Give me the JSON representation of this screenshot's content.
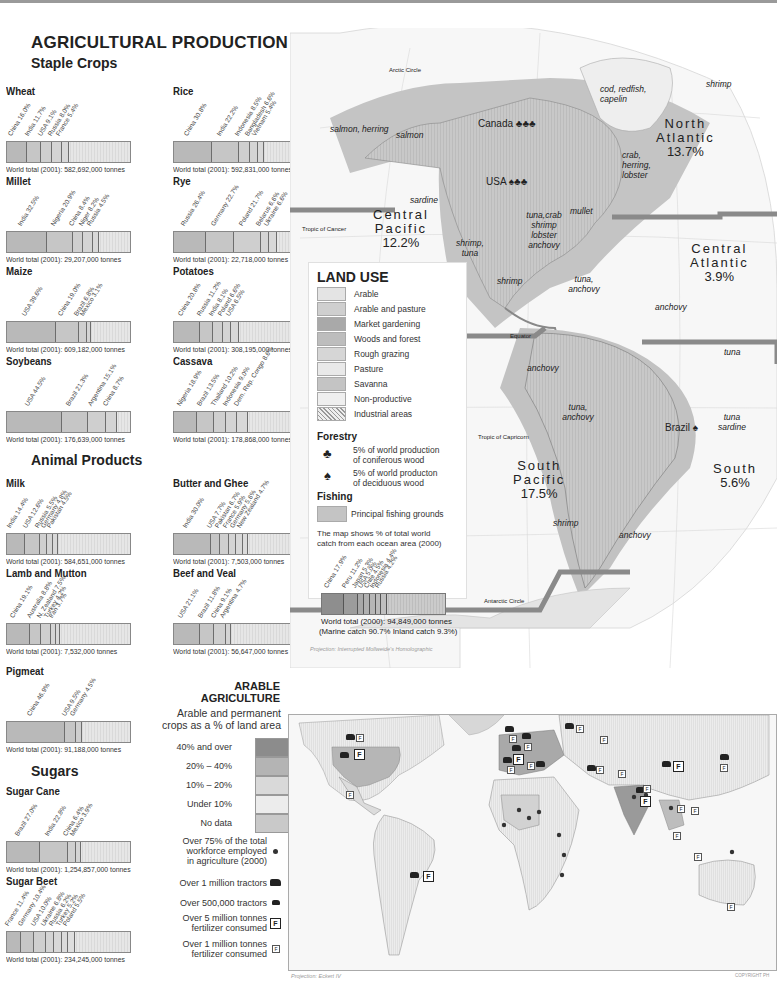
{
  "title": "AGRICULTURAL PRODUCTION",
  "sections": {
    "staple": "Staple Crops",
    "animal": "Animal Products",
    "sugars": "Sugars"
  },
  "chart_data": [
    {
      "type": "bar",
      "title": "Wheat",
      "stacked": true,
      "categories": [
        "China",
        "India",
        "USA",
        "Russia",
        "France"
      ],
      "values": [
        16.0,
        11.7,
        9.1,
        8.0,
        5.4
      ],
      "unit": "% of world total",
      "total": "World total (2001): 582,692,000 tonnes"
    },
    {
      "type": "bar",
      "title": "Rice",
      "stacked": true,
      "categories": [
        "China",
        "India",
        "Indonesia",
        "Bangladesh",
        "Vietnam"
      ],
      "values": [
        30.8,
        22.2,
        8.5,
        6.6,
        5.4
      ],
      "unit": "% of world total",
      "total": "World total (2001): 592,831,000 tonnes"
    },
    {
      "type": "bar",
      "title": "Millet",
      "stacked": true,
      "categories": [
        "India",
        "Nigeria",
        "China",
        "Niger",
        "Russia"
      ],
      "values": [
        32.5,
        20.9,
        8.4,
        8.2,
        4.5
      ],
      "unit": "% of world total",
      "total": "World total (2001): 29,207,000 tonnes"
    },
    {
      "type": "bar",
      "title": "Rye",
      "stacked": true,
      "categories": [
        "Russia",
        "Germany",
        "Poland",
        "Belarus",
        "Ukraine"
      ],
      "values": [
        26.4,
        22.7,
        21.7,
        6.6,
        6.6
      ],
      "unit": "% of world total",
      "total": "World total (2001): 22,718,000 tonnes"
    },
    {
      "type": "bar",
      "title": "Maize",
      "stacked": true,
      "categories": [
        "USA",
        "China",
        "Brazil",
        "Mexico"
      ],
      "values": [
        39.6,
        19.0,
        6.8,
        3.1
      ],
      "unit": "% of world total",
      "total": "World total (2001): 609,182,000 tonnes"
    },
    {
      "type": "bar",
      "title": "Potatoes",
      "stacked": true,
      "categories": [
        "China",
        "Russia",
        "India",
        "Poland",
        "USA"
      ],
      "values": [
        20.8,
        11.2,
        8.1,
        6.6,
        6.5
      ],
      "unit": "% of world total",
      "total": "World total (2001): 308,195,000 tonnes"
    },
    {
      "type": "bar",
      "title": "Soybeans",
      "stacked": true,
      "categories": [
        "USA",
        "Brazil",
        "Argentina",
        "China"
      ],
      "values": [
        44.5,
        21.3,
        15.1,
        8.7
      ],
      "unit": "% of world total",
      "total": "World total (2001): 176,639,000 tonnes"
    },
    {
      "type": "bar",
      "title": "Cassava",
      "stacked": true,
      "categories": [
        "Nigeria",
        "Brazil",
        "Thailand",
        "Indonesia",
        "Dem. Rep. Congo"
      ],
      "values": [
        18.9,
        13.5,
        10.2,
        9.0,
        8.6
      ],
      "unit": "% of world total",
      "total": "World total (2001): 178,868,000 tonnes"
    },
    {
      "type": "bar",
      "title": "Milk",
      "stacked": true,
      "categories": [
        "India",
        "USA",
        "Russia",
        "Germany",
        "Pakistan"
      ],
      "values": [
        14.4,
        12.6,
        5.5,
        4.8,
        4.5
      ],
      "unit": "% of world total",
      "total": "World total (2001): 584,651,000 tonnes"
    },
    {
      "type": "bar",
      "title": "Butter and Ghee",
      "stacked": true,
      "categories": [
        "India",
        "USA",
        "Pakistan",
        "France",
        "Germany",
        "New Zealand"
      ],
      "values": [
        30.0,
        7.7,
        6.7,
        5.9,
        5.6,
        4.7
      ],
      "unit": "% of world total",
      "total": "World total (2001): 7,503,000 tonnes"
    },
    {
      "type": "bar",
      "title": "Lamb and Mutton",
      "stacked": true,
      "categories": [
        "China",
        "Australia",
        "N. Zealand",
        "Turkey",
        "Iran"
      ],
      "values": [
        19.1,
        8.8,
        7.5,
        4.2,
        3.7
      ],
      "unit": "% of world total",
      "total": "World total (2001): 7,532,000 tonnes"
    },
    {
      "type": "bar",
      "title": "Beef and Veal",
      "stacked": true,
      "categories": [
        "USA",
        "Brazil",
        "China",
        "Argentina"
      ],
      "values": [
        21.1,
        11.8,
        9.1,
        4.7
      ],
      "unit": "% of world total",
      "total": "World total (2001): 56,647,000 tonnes"
    },
    {
      "type": "bar",
      "title": "Pigmeat",
      "stacked": true,
      "categories": [
        "China",
        "USA",
        "Germany"
      ],
      "values": [
        46.9,
        9.5,
        4.5
      ],
      "unit": "% of world total",
      "total": "World total (2001): 91,188,000 tonnes"
    },
    {
      "type": "bar",
      "title": "Sugar Cane",
      "stacked": true,
      "categories": [
        "Brazil",
        "India",
        "China",
        "Mexico"
      ],
      "values": [
        27.0,
        22.8,
        6.4,
        3.9
      ],
      "unit": "% of world total",
      "total": "World total (2001): 1,254,857,000 tonnes"
    },
    {
      "type": "bar",
      "title": "Sugar Beet",
      "stacked": true,
      "categories": [
        "France",
        "Germany",
        "USA",
        "Ukraine",
        "Russia",
        "Turkey",
        "Poland"
      ],
      "values": [
        11.4,
        10.4,
        10.0,
        6.8,
        6.2,
        5.2,
        5.5
      ],
      "unit": "% of world total",
      "total": "World total (2001): 234,245,000 tonnes"
    },
    {
      "type": "bar",
      "title": "Fishing catch",
      "stacked": true,
      "categories": [
        "China",
        "Peru",
        "Japan",
        "USA",
        "Chile",
        "Indonesia",
        "Russia"
      ],
      "values": [
        17.9,
        11.2,
        5.3,
        5.0,
        4.5,
        4.4,
        4.2
      ],
      "unit": "% of world total",
      "total": "World total (2000): 94,849,000 tonnes",
      "note": "(Marine catch 90.7%  Inland catch 9.3%)"
    }
  ],
  "charts": [
    {
      "title": "Wheat",
      "labels": [
        "China 16.0%",
        "India 11.7%",
        "USA 9.1%",
        "Russia 8.0%",
        "France 5.4%"
      ],
      "widths": [
        16.0,
        11.7,
        9.1,
        8.0,
        5.4
      ],
      "total": "World total (2001): 582,692,000 tonnes"
    },
    {
      "title": "Rice",
      "labels": [
        "China 30.8%",
        "India 22.2%",
        "Indonesia 8.5%",
        "Bangladesh 6.6%",
        "Vietnam 5.4%"
      ],
      "widths": [
        30.8,
        22.2,
        8.5,
        6.6,
        5.4
      ],
      "total": "World total (2001): 592,831,000 tonnes"
    },
    {
      "title": "Millet",
      "labels": [
        "India 32.5%",
        "Nigeria 20.9%",
        "China 8.4%",
        "Niger 8.2%",
        "Russia 4.5%"
      ],
      "widths": [
        32.5,
        20.9,
        8.4,
        8.2,
        4.5
      ],
      "total": "World total (2001): 29,207,000 tonnes"
    },
    {
      "title": "Rye",
      "labels": [
        "Russia 26.4%",
        "Germany 22.7%",
        "Poland 21.7%",
        "Belarus 6.6%",
        "Ukraine 6.6%"
      ],
      "widths": [
        26.4,
        22.7,
        21.7,
        6.6,
        6.6
      ],
      "total": "World total (2001): 22,718,000 tonnes"
    },
    {
      "title": "Maize",
      "labels": [
        "USA 39.6%",
        "China 19.0%",
        "Brazil 6.8%",
        "Mexico 3.1%"
      ],
      "widths": [
        39.6,
        19.0,
        6.8,
        3.1
      ],
      "total": "World total (2001): 609,182,000 tonnes"
    },
    {
      "title": "Potatoes",
      "labels": [
        "China 20.8%",
        "Russia 11.2%",
        "India 8.1%",
        "Poland 6.6%",
        "USA 6.5%"
      ],
      "widths": [
        20.8,
        11.2,
        8.1,
        6.6,
        6.5
      ],
      "total": "World total (2001): 308,195,000 tonnes"
    },
    {
      "title": "Soybeans",
      "labels": [
        "USA 44.5%",
        "Brazil 21.3%",
        "Argentina 15.1%",
        "China 8.7%"
      ],
      "widths": [
        44.5,
        21.3,
        15.1,
        8.7
      ],
      "total": "World total (2001): 176,639,000 tonnes"
    },
    {
      "title": "Cassava",
      "labels": [
        "Nigeria 18.9%",
        "Brazil 13.5%",
        "Thailand 10.2%",
        "Indonesia 9.0%",
        "Dem. Rep. Congo 8.6%"
      ],
      "widths": [
        18.9,
        13.5,
        10.2,
        9.0,
        8.6
      ],
      "total": "World total (2001): 178,868,000 tonnes"
    },
    {
      "title": "Milk",
      "labels": [
        "India 14.4%",
        "USA 12.6%",
        "Russia 5.5%",
        "Germany 4.8%",
        "Pakistan 4.5%"
      ],
      "widths": [
        14.4,
        12.6,
        5.5,
        4.8,
        4.5
      ],
      "total": "World total (2001): 584,651,000 tonnes"
    },
    {
      "title": "Butter and Ghee",
      "labels": [
        "India 30.0%",
        "USA 7.7%",
        "Pakistan 6.7%",
        "France 5.9%",
        "Germany 5.6%",
        "New Zealand 4.7%"
      ],
      "widths": [
        30.0,
        7.7,
        6.7,
        5.9,
        5.6,
        4.7
      ],
      "total": "World total (2001): 7,503,000 tonnes"
    },
    {
      "title": "Lamb and Mutton",
      "labels": [
        "China 19.1%",
        "Australia 8.8%",
        "N. Zealand 7.5%",
        "Turkey 4.2%",
        "Iran 3.7%"
      ],
      "widths": [
        19.1,
        8.8,
        7.5,
        4.2,
        3.7
      ],
      "total": "World total (2001): 7,532,000 tonnes"
    },
    {
      "title": "Beef and Veal",
      "labels": [
        "USA 21.1%",
        "Brazil 11.8%",
        "China 9.1%",
        "Argentina 4.7%"
      ],
      "widths": [
        21.1,
        11.8,
        9.1,
        4.7
      ],
      "total": "World total (2001): 56,647,000 tonnes"
    },
    {
      "title": "Pigmeat",
      "labels": [
        "China 46.9%",
        "USA 9.5%",
        "Germany 4.5%"
      ],
      "widths": [
        46.9,
        9.5,
        4.5
      ],
      "total": "World total (2001): 91,188,000 tonnes"
    },
    {
      "title": "Sugar Cane",
      "labels": [
        "Brazil 27.0%",
        "India 22.8%",
        "China 6.4%",
        "Mexico 3.9%"
      ],
      "widths": [
        27.0,
        22.8,
        6.4,
        3.9
      ],
      "total": "World total (2001): 1,254,857,000 tonnes"
    },
    {
      "title": "Sugar Beet",
      "labels": [
        "France 11.4%",
        "Germany 10.4%",
        "USA 10.0%",
        "Ukraine 6.8%",
        "Russia 6.2%",
        "Turkey 5.2%",
        "Poland 5.5%"
      ],
      "widths": [
        11.4,
        10.4,
        10.0,
        6.8,
        6.2,
        5.2,
        5.5
      ],
      "total": "World total (2001): 234,245,000 tonnes"
    }
  ],
  "landuse": {
    "title": "LAND USE",
    "items": [
      {
        "label": "Arable",
        "color": "#e4e4e4"
      },
      {
        "label": "Arable and pasture",
        "color": "#cfcfcf"
      },
      {
        "label": "Market gardening",
        "color": "#a9a9a9"
      },
      {
        "label": "Woods and forest",
        "color": "#bdbdbd"
      },
      {
        "label": "Rough grazing",
        "color": "#d6d6d6"
      },
      {
        "label": "Pasture",
        "color": "#e9e9e9"
      },
      {
        "label": "Savanna",
        "color": "#c4c4c4"
      },
      {
        "label": "Non-productive",
        "color": "#efefef"
      },
      {
        "label": "Industrial areas",
        "color": "hatched"
      }
    ],
    "forestry_title": "Forestry",
    "forestry": [
      {
        "icon": "conifer-tree-icon",
        "text1": "5% of world production",
        "text2": "of coniferous wood"
      },
      {
        "icon": "deciduous-tree-icon",
        "text1": "5% of world producton",
        "text2": "of deciduous wood"
      }
    ],
    "fishing_title": "Fishing",
    "fishing_item": "Principal fishing grounds",
    "fishing_note1": "The map shows % of total world",
    "fishing_note2": "catch from each ocean area (2000)",
    "fish_chart": {
      "labels": [
        "China 17.9%",
        "Peru 11.2%",
        "Japan 5.3%",
        "USA 5.0%",
        "Chile 4.5%",
        "Indonesia 4.4%",
        "Russia 4.2%"
      ],
      "widths": [
        17.9,
        11.2,
        5.3,
        5.0,
        4.5,
        4.4,
        4.2
      ],
      "total": "World total (2000): 94,849,000 tonnes",
      "note": "(Marine catch 90.7%  Inland catch 9.3%)"
    }
  },
  "globe": {
    "projection": "Projection: Interrupted Mollweide's Homolographic",
    "lines": {
      "arctic": "Arctic Circle",
      "cancer": "Tropic of Cancer",
      "equator": "Equator",
      "capricorn": "Tropic of Capricorn",
      "antarctic": "Antarctic Circle"
    },
    "countries": {
      "canada": "Canada",
      "usa": "USA",
      "brazil": "Brazil"
    },
    "oceans": [
      {
        "name1": "North",
        "name2": "Atlantic",
        "pct": "13.7%"
      },
      {
        "name1": "Central",
        "name2": "Pacific",
        "pct": "12.2%"
      },
      {
        "name1": "Central",
        "name2": "Atlantic",
        "pct": "3.9%"
      },
      {
        "name1": "South",
        "name2": "Pacific",
        "pct": "17.5%"
      },
      {
        "name1": "South",
        "name2": "",
        "pct": "5.6%"
      }
    ],
    "fish": {
      "salmon_herring": "salmon, herring",
      "salmon": "salmon",
      "shrimp_n": "shrimp",
      "cod": "cod, redfish, capelin",
      "crab": "crab, herring, lobster",
      "sardine": "sardine",
      "gulf": "tuna,crab shrimp lobster anchovy",
      "mullet": "mullet",
      "shrimp_tuna": "shrimp, tuna",
      "shrimp_c": "shrimp",
      "tuna_anchovy_c": "tuna, anchovy",
      "anchovy_n": "anchovy",
      "anchovy_w": "anchovy",
      "tuna_e": "tuna",
      "tuna_anchovy_s": "tuna, anchovy",
      "tuna_sardine": "tuna sardine",
      "shrimp_s": "shrimp",
      "anchovy_s": "anchovy"
    }
  },
  "arable": {
    "title1": "ARABLE",
    "title2": "AGRICULTURE",
    "sub1": "Arable and permanent",
    "sub2": "crops as a % of land area",
    "classes": [
      {
        "label": "40% and over",
        "color": "#8c8c8c"
      },
      {
        "label": "20% – 40%",
        "color": "#b4b4b4"
      },
      {
        "label": "10% – 20%",
        "color": "#d9d9d9"
      },
      {
        "label": "Under 10%",
        "color": "#ececec"
      },
      {
        "label": "No data",
        "color": "#c9c9c9"
      }
    ],
    "symbols": [
      {
        "text": "Over 75% of the total workforce employed in agriculture (2000)",
        "icon": "dot-icon"
      },
      {
        "text": "Over 1 million tractors",
        "icon": "large-tractor-icon"
      },
      {
        "text": "Over 500,000 tractors",
        "icon": "small-tractor-icon"
      },
      {
        "text": "Over 5 million tonnes fertilizer consumed",
        "icon": "large-fertilizer-icon"
      },
      {
        "text": "Over 1 million tonnes fertilizer consumed",
        "icon": "small-fertilizer-icon"
      }
    ],
    "sym_lines": [
      [
        "Over 75% of the total",
        "workforce employed",
        "in agriculture (2000)"
      ],
      [
        "Over 1 million tractors"
      ],
      [
        "Over 500,000 tractors"
      ],
      [
        "Over 5 million tonnes",
        "fertilizer consumed"
      ],
      [
        "Over 1 million tonnes",
        "fertilizer consumed"
      ]
    ],
    "projection": "Projection: Eckert IV",
    "copyright": "COPYRIGHT PH",
    "fertilizer_glyph": "F"
  }
}
